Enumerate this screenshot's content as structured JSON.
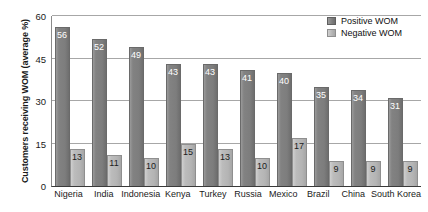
{
  "chart_data": {
    "type": "bar",
    "title": "",
    "xlabel": "",
    "ylabel": "Customers receiving WOM (average %)",
    "ylim": [
      0,
      60
    ],
    "yticks": [
      0,
      15,
      30,
      45,
      60
    ],
    "ytick_labels": [
      "0",
      "15",
      "30",
      "45",
      "60"
    ],
    "grid": true,
    "legend_position": "top-right",
    "categories": [
      "Nigeria",
      "India",
      "Indonesia",
      "Kenya",
      "Turkey",
      "Russia",
      "Mexico",
      "Brazil",
      "China",
      "South Korea"
    ],
    "series": [
      {
        "name": "Positive WOM",
        "color": "#7d7d7d",
        "values": [
          56,
          52,
          49,
          43,
          43,
          41,
          40,
          35,
          34,
          31
        ]
      },
      {
        "name": "Negative WOM",
        "color": "#b4b4b4",
        "values": [
          13,
          11,
          10,
          15,
          13,
          10,
          17,
          9,
          9,
          9
        ]
      }
    ]
  },
  "legend": {
    "items": [
      {
        "label": "Positive WOM",
        "swatch": "pos"
      },
      {
        "label": "Negative WOM",
        "swatch": "neg"
      }
    ]
  }
}
